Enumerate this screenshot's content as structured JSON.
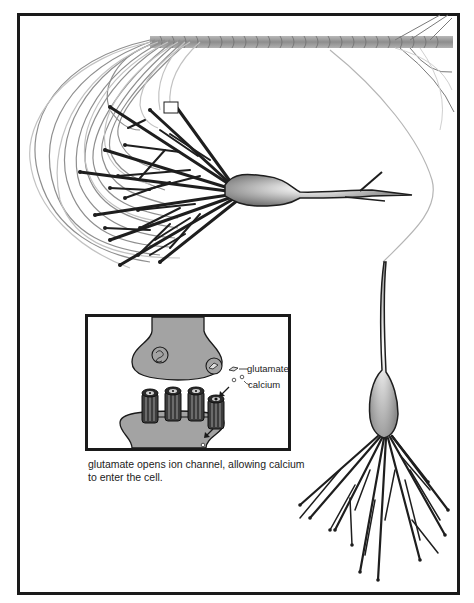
{
  "figure": {
    "colors": {
      "frame": "#1a1a1a",
      "dendrite_dark": "#1e1e1e",
      "fiber_gray": "#8c8c8c",
      "fiber_light": "#bdbdbd",
      "cell_fill": "#a9a9a9",
      "soma_highlight": "#ffffff",
      "synapse_fill": "#a3a3a3"
    },
    "marker_square": {
      "x": 164,
      "y": 102,
      "w": 14,
      "h": 11
    }
  },
  "inset": {
    "labels": {
      "glutamate": "glutamate",
      "calcium": "calcium"
    },
    "channels_count": 4
  },
  "caption": {
    "line1": "glutamate opens ion channel, allowing calcium",
    "line2": "to enter the cell."
  }
}
